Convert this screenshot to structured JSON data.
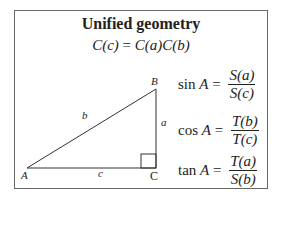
{
  "title": "Unified geometry",
  "main_equation": {
    "lhs": "C(c)",
    "eq": " = ",
    "rhs": "C(a)C(b)"
  },
  "triangle": {
    "vertices": {
      "A": "A",
      "B": "B",
      "C": "C"
    },
    "sides": {
      "a": "a",
      "b": "b",
      "c": "c"
    },
    "right_angle_at": "C"
  },
  "formulas": [
    {
      "lhs": "sin",
      "var": "A",
      "eq": " = ",
      "num": "S(a)",
      "den": "S(c)"
    },
    {
      "lhs": "cos",
      "var": "A",
      "eq": " = ",
      "num": "T(b)",
      "den": "T(c)"
    },
    {
      "lhs": "tan",
      "var": "A",
      "eq": " = ",
      "num": "T(a)",
      "den": "S(b)"
    }
  ]
}
